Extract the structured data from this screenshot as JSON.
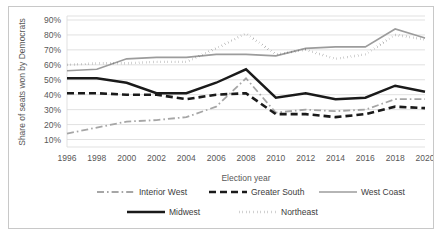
{
  "chart_data": {
    "type": "line",
    "title": "",
    "xlabel": "Election year",
    "ylabel": "Share of seats won by Democrats",
    "categories": [
      1996,
      1998,
      2000,
      2002,
      2004,
      2006,
      2008,
      2010,
      2012,
      2014,
      2016,
      2018,
      2020
    ],
    "xtick_labels": [
      "1996",
      "1998",
      "2000",
      "2002",
      "2004",
      "2006",
      "2008",
      "2010",
      "2012",
      "2014",
      "2016",
      "2018",
      "2020"
    ],
    "ytick_labels": [
      "10%",
      "20%",
      "30%",
      "40%",
      "50%",
      "60%",
      "70%",
      "80%",
      "90%"
    ],
    "ytick_values": [
      10,
      20,
      30,
      40,
      50,
      60,
      70,
      80,
      90
    ],
    "ylim": [
      5,
      92
    ],
    "grid": "horizontal",
    "legend_position": "bottom",
    "series": [
      {
        "name": "Interior West",
        "values": [
          14,
          18,
          22,
          23,
          25,
          32,
          51,
          28,
          30,
          29,
          30,
          37,
          37
        ],
        "color": "#a6a6a6",
        "width": 1.8,
        "dash": "7,3,1.6,3"
      },
      {
        "name": "Greater South",
        "values": [
          41,
          41,
          40,
          40,
          37,
          40,
          41,
          27,
          27,
          25,
          27,
          32,
          31
        ],
        "color": "#1a1a1a",
        "width": 2.6,
        "dash": "7,4"
      },
      {
        "name": "West Coast",
        "values": [
          56,
          57,
          64,
          65,
          65,
          67,
          67,
          66,
          71,
          72,
          72,
          84,
          78
        ],
        "color": "#9c9c9c",
        "width": 1.6,
        "dash": "none"
      },
      {
        "name": "Midwest",
        "values": [
          51,
          51,
          48,
          41,
          41,
          48,
          57,
          38,
          41,
          37,
          38,
          46,
          42
        ],
        "color": "#1a1a1a",
        "width": 2.4,
        "dash": "none"
      },
      {
        "name": "Northeast",
        "values": [
          60,
          61,
          61,
          62,
          62,
          71,
          81,
          67,
          70,
          64,
          67,
          80,
          77
        ],
        "color": "#1a1a1a",
        "width": 2.4,
        "dash": "0.2,3.4"
      }
    ]
  },
  "legend": {
    "entries": [
      {
        "label": "Interior West"
      },
      {
        "label": "Greater South"
      },
      {
        "label": "West Coast"
      },
      {
        "label": "Midwest"
      },
      {
        "label": "Northeast"
      }
    ]
  }
}
